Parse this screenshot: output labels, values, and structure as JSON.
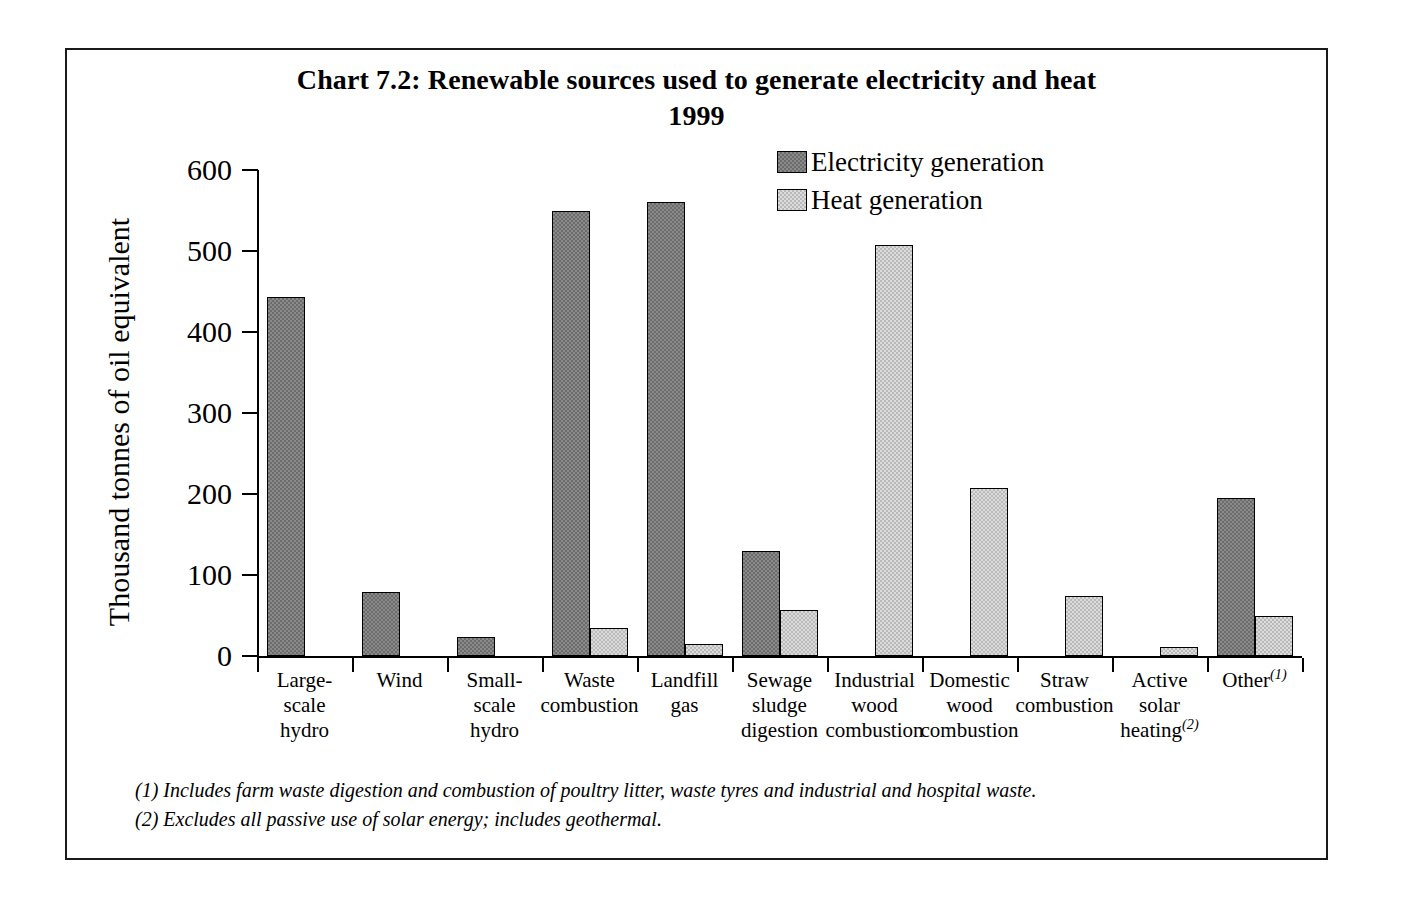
{
  "chart_data": {
    "type": "bar",
    "title": "Chart 7.2:  Renewable sources used to generate electricity and heat",
    "subtitle": "1999",
    "xlabel": "",
    "ylabel": "Thousand tonnes of oil equivalent",
    "ylim": [
      0,
      600
    ],
    "yticks": [
      0,
      100,
      200,
      300,
      400,
      500,
      600
    ],
    "ytick_labels": [
      "0",
      "100",
      "200",
      "300",
      "400",
      "500",
      "600"
    ],
    "grid": false,
    "legend_position": "top-right",
    "categories": [
      "Large-\nscale\nhydro",
      "Wind",
      "Small-\nscale\nhydro",
      "Waste\ncombustion",
      "Landfill\ngas",
      "Sewage\nsludge\ndigestion",
      "Industrial\nwood\ncombustion",
      "Domestic\nwood\ncombustion",
      "Straw\ncombustion",
      "Active\nsolar\nheating",
      "Other"
    ],
    "series": [
      {
        "name": "Electricity generation",
        "color": "#8a8a8a",
        "values": [
          443,
          79,
          23,
          549,
          560,
          130,
          0,
          0,
          0,
          0,
          195
        ]
      },
      {
        "name": "Heat generation",
        "color": "#dcdcdc",
        "values": [
          0,
          0,
          0,
          34,
          15,
          57,
          508,
          207,
          74,
          11,
          50
        ]
      }
    ],
    "annotations": [
      "(1) Includes farm waste digestion and combustion of poultry litter, waste tyres and industrial and hospital waste.",
      "(2) Excludes all passive use of solar energy; includes geothermal."
    ]
  },
  "title": {
    "line1": "Chart 7.2:  Renewable sources used to generate electricity and heat",
    "line2": "1999"
  },
  "axes": {
    "y_title": "Thousand tonnes of oil equivalent",
    "y_ticks": [
      "600",
      "500",
      "400",
      "300",
      "200",
      "100",
      "0"
    ]
  },
  "legend": {
    "items": [
      {
        "label": "Electricity generation",
        "swatch": "electricity"
      },
      {
        "label": "Heat generation",
        "swatch": "heat"
      }
    ]
  },
  "categories": [
    {
      "line1": "Large-",
      "line2": "scale",
      "line3": "hydro",
      "sup": ""
    },
    {
      "line1": "Wind",
      "line2": "",
      "line3": "",
      "sup": ""
    },
    {
      "line1": "Small-",
      "line2": "scale",
      "line3": "hydro",
      "sup": ""
    },
    {
      "line1": "Waste",
      "line2": "combustion",
      "line3": "",
      "sup": ""
    },
    {
      "line1": "Landfill",
      "line2": "gas",
      "line3": "",
      "sup": ""
    },
    {
      "line1": "Sewage",
      "line2": "sludge",
      "line3": "digestion",
      "sup": ""
    },
    {
      "line1": "Industrial",
      "line2": "wood",
      "line3": "combustion",
      "sup": ""
    },
    {
      "line1": "Domestic",
      "line2": "wood",
      "line3": "combustion",
      "sup": ""
    },
    {
      "line1": "Straw",
      "line2": "combustion",
      "line3": "",
      "sup": ""
    },
    {
      "line1": "Active",
      "line2": "solar",
      "line3": "heating",
      "sup": "(2)"
    },
    {
      "line1": "Other",
      "line2": "",
      "line3": "",
      "sup": "(1)"
    }
  ],
  "footnotes": {
    "note1": "(1) Includes farm waste digestion and combustion of poultry litter, waste tyres and industrial and hospital waste.",
    "note2": "(2) Excludes all passive use of solar energy; includes geothermal."
  }
}
